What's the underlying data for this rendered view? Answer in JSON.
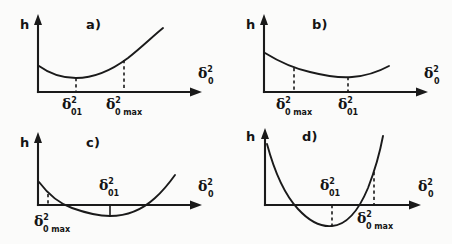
{
  "figure": {
    "title": "",
    "background_color": "#fbfbfa",
    "ink_color": "#1a1a1a",
    "axis_labels": {
      "y": "h",
      "x_base": "δ",
      "x_superscript": "2",
      "x_subscript": "0"
    },
    "marker_labels": {
      "delta_01": {
        "base": "δ",
        "sup": "2",
        "sub": "01"
      },
      "delta_0max": {
        "base": "δ",
        "sup": "2",
        "sub": "0 max"
      }
    }
  },
  "panels": [
    {
      "id": "a",
      "letter": "a)",
      "y_axis_label": "h",
      "x_axis_label": {
        "base": "δ",
        "sup": "2",
        "sub": "0"
      },
      "description": "Curve starts at positive h, shallow minimum above axis, rises steeply; both markers to right of minimum order: delta01 then delta0max",
      "markers": [
        {
          "name": "delta_01",
          "base": "δ",
          "sup": "2",
          "sub": "01",
          "position": "left",
          "side": "below-axis"
        },
        {
          "name": "delta_0max",
          "base": "δ",
          "sup": "2",
          "sub": "0 max",
          "position": "right",
          "side": "below-axis"
        }
      ],
      "curve_crosses_axis": false,
      "minimum_above_axis": true
    },
    {
      "id": "b",
      "letter": "b)",
      "y_axis_label": "h",
      "x_axis_label": {
        "base": "δ",
        "sup": "2",
        "sub": "0"
      },
      "description": "Curve decreases to a broad shallow minimum above axis then turns up slightly; delta0max left of delta01",
      "markers": [
        {
          "name": "delta_0max",
          "base": "δ",
          "sup": "2",
          "sub": "0 max",
          "position": "left",
          "side": "below-axis"
        },
        {
          "name": "delta_01",
          "base": "δ",
          "sup": "2",
          "sub": "01",
          "position": "right",
          "side": "below-axis"
        }
      ],
      "curve_crosses_axis": false,
      "minimum_above_axis": true
    },
    {
      "id": "c",
      "letter": "c)",
      "y_axis_label": "h",
      "x_axis_label": {
        "base": "δ",
        "sup": "2",
        "sub": "0"
      },
      "description": "Curve falls through the axis early, shallow minimum below axis, rises back through axis; delta0max marked near axis crossing at left, delta01 above axis at minimum",
      "markers": [
        {
          "name": "delta_0max",
          "base": "δ",
          "sup": "2",
          "sub": "0 max",
          "position": "left",
          "side": "below-axis"
        },
        {
          "name": "delta_01",
          "base": "δ",
          "sup": "2",
          "sub": "01",
          "position": "middle",
          "side": "above-axis"
        }
      ],
      "curve_crosses_axis": true,
      "minimum_above_axis": false
    },
    {
      "id": "d",
      "letter": "d)",
      "y_axis_label": "h",
      "x_axis_label": {
        "base": "δ",
        "sup": "2",
        "sub": "0"
      },
      "description": "Deep parabola dipping well below axis, rising steeply; delta01 above axis at minimum, delta0max below axis at right where curve is high",
      "markers": [
        {
          "name": "delta_01",
          "base": "δ",
          "sup": "2",
          "sub": "01",
          "position": "middle",
          "side": "above-axis"
        },
        {
          "name": "delta_0max",
          "base": "δ",
          "sup": "2",
          "sub": "0 max",
          "position": "right",
          "side": "below-axis"
        }
      ],
      "curve_crosses_axis": true,
      "minimum_above_axis": false
    }
  ]
}
